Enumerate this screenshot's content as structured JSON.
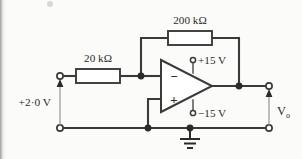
{
  "figure": {
    "background_color": "#fbfbfa",
    "ink_color": "#3a3a3a"
  },
  "components": {
    "input_resistor": {
      "label": "20 kΩ",
      "name": "R1",
      "value": "20",
      "unit": "kΩ"
    },
    "feedback_resistor": {
      "label": "200 kΩ",
      "name": "Rf",
      "value": "200",
      "unit": "kΩ"
    },
    "opamp": {
      "inverting_sign": "−",
      "noninverting_sign": "+",
      "positive_supply_label": "+15 V",
      "negative_supply_label": "−15 V"
    }
  },
  "sources": {
    "input_voltage_label": "+2·0 V"
  },
  "outputs": {
    "output_voltage_label": "V",
    "output_voltage_subscript": "o"
  },
  "symbols": {
    "ground": "ground-symbol"
  }
}
